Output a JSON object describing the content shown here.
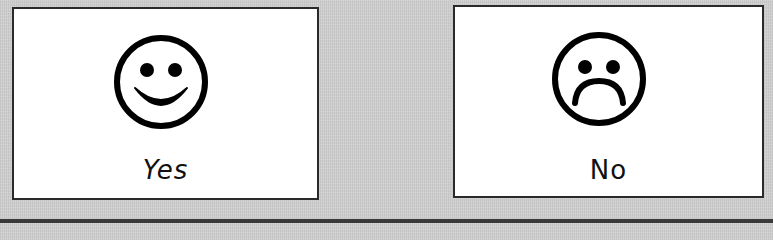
{
  "colors": {
    "background": "#cfcfcf",
    "card_background": "#ffffff",
    "card_border": "#2a2a2a",
    "icon_stroke": "#000000",
    "label_text": "#111111"
  },
  "cards": [
    {
      "id": "yes",
      "icon": "smiley-face-icon",
      "label": "Yes"
    },
    {
      "id": "no",
      "icon": "sad-face-icon",
      "label": "No"
    }
  ]
}
